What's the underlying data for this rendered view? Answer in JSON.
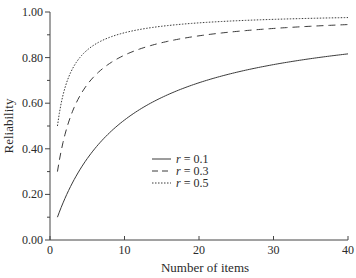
{
  "chart_data": {
    "type": "line",
    "title": "",
    "xlabel": "Number of items",
    "ylabel": "Reliability",
    "xlim": [
      0,
      40
    ],
    "ylim": [
      0.0,
      1.0
    ],
    "xticks": [
      0,
      10,
      20,
      30,
      40
    ],
    "xtick_labels": [
      "0",
      "10",
      "20",
      "30",
      "40"
    ],
    "yticks": [
      0.0,
      0.2,
      0.4,
      0.6,
      0.8,
      1.0
    ],
    "ytick_labels": [
      "0.00",
      "0.20",
      "0.40",
      "0.60",
      "0.80",
      "1.00"
    ],
    "grid": false,
    "legend_position": "center-right (inside plot)",
    "formula": "Spearman-Brown: R = n*r / (1 + (n-1)*r)",
    "x": [
      1,
      2,
      3,
      4,
      5,
      6,
      8,
      10,
      15,
      20,
      25,
      30,
      35,
      40
    ],
    "series": [
      {
        "name": "r = 0.1",
        "r": 0.1,
        "style": "solid",
        "values": [
          0.1,
          0.18,
          0.25,
          0.31,
          0.36,
          0.4,
          0.47,
          0.53,
          0.63,
          0.69,
          0.74,
          0.77,
          0.8,
          0.82
        ]
      },
      {
        "name": "r = 0.3",
        "r": 0.3,
        "style": "dashed",
        "values": [
          0.3,
          0.46,
          0.56,
          0.63,
          0.68,
          0.72,
          0.77,
          0.81,
          0.87,
          0.9,
          0.91,
          0.93,
          0.94,
          0.94
        ]
      },
      {
        "name": "r = 0.5",
        "r": 0.5,
        "style": "dotted",
        "values": [
          0.5,
          0.67,
          0.75,
          0.8,
          0.83,
          0.86,
          0.89,
          0.91,
          0.94,
          0.95,
          0.96,
          0.97,
          0.97,
          0.98
        ]
      }
    ]
  },
  "legend": {
    "items": [
      {
        "symbol": "r",
        "text": " = 0.1",
        "style": "solid"
      },
      {
        "symbol": "r",
        "text": " = 0.3",
        "style": "dashed"
      },
      {
        "symbol": "r",
        "text": " = 0.5",
        "style": "dotted"
      }
    ]
  },
  "colors": {
    "line": "#3a3a3a",
    "axis": "#444444",
    "background": "#ffffff"
  }
}
